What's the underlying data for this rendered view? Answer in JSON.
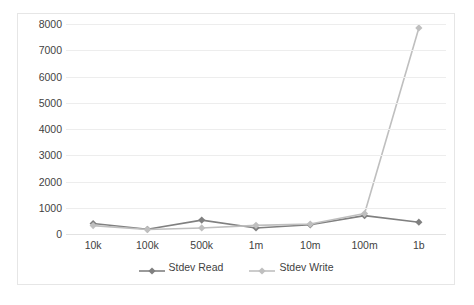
{
  "chart_data": {
    "type": "line",
    "title": "",
    "subtitle": "",
    "xlabel": "",
    "ylabel": "",
    "categories": [
      "10k",
      "100k",
      "500k",
      "1m",
      "10m",
      "100m",
      "1b"
    ],
    "series": [
      {
        "name": "Stdev Read",
        "color": "#808080",
        "marker": "diamond",
        "values": [
          400,
          180,
          530,
          230,
          350,
          700,
          450
        ]
      },
      {
        "name": "Stdev Write",
        "color": "#bfbfbf",
        "marker": "diamond",
        "values": [
          320,
          170,
          230,
          330,
          380,
          780,
          7850
        ]
      }
    ],
    "ylim": [
      0,
      8000
    ],
    "ytick_step": 1000,
    "yticks": [
      "0",
      "1000",
      "2000",
      "3000",
      "4000",
      "5000",
      "6000",
      "7000",
      "8000"
    ],
    "grid": true,
    "grid_color": "#ededed",
    "legend_position": "bottom",
    "plot_border_color": "#e6e6e6",
    "background": "#ffffff",
    "text_color": "#3f3f3f"
  },
  "legend": {
    "items": [
      {
        "label": "Stdev Read",
        "color": "#808080"
      },
      {
        "label": "Stdev Write",
        "color": "#bfbfbf"
      }
    ]
  }
}
